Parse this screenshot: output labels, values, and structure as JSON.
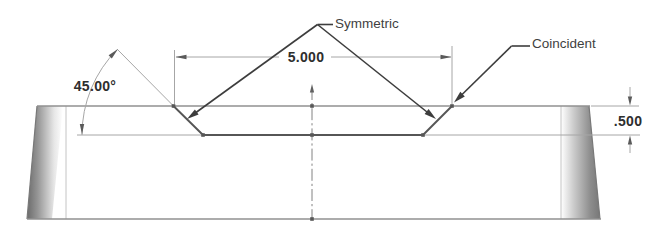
{
  "drawing": {
    "relation_labels": {
      "symmetric": "Symmetric",
      "coincident": "Coincident"
    },
    "dimensions": {
      "angle": "45.00°",
      "groove_width": "5.000",
      "groove_depth": ".500"
    },
    "icons": {
      "leader_arrowhead": "filled-triangle-arrow",
      "dimension_arrowhead": "filled-triangle-arrow",
      "centerline_arrowhead": "filled-triangle-arrow",
      "sketch_point_marker": "small-square-dot"
    },
    "colors": {
      "background": "#ffffff",
      "outline": "#909090",
      "silhouette_edge": "#787878",
      "edge_shading_dark": "#6b6b6b",
      "groove_edge": "#565656",
      "dimension_line": "#a6a6a6",
      "dimension_text": "#2e2e2e",
      "leader_line": "#3d3d3d",
      "label_text": "#3f3f3f",
      "centerline": "#828282"
    }
  }
}
